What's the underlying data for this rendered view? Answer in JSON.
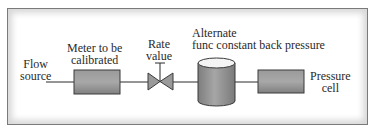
{
  "diagram": {
    "type": "flow-calibration-setup",
    "labels": {
      "flow_source": [
        "Flow",
        "source"
      ],
      "meter": [
        "Meter to be",
        "calibrated"
      ],
      "rate_valve": [
        "Rate",
        "value"
      ],
      "back_pressure": [
        "Alternate",
        "func constant back pressure"
      ],
      "pressure_cell": [
        "Pressure",
        "cell"
      ]
    },
    "components": [
      {
        "id": "flow-source",
        "shape": "line-start"
      },
      {
        "id": "meter",
        "shape": "rectangle"
      },
      {
        "id": "rate-valve",
        "shape": "valve"
      },
      {
        "id": "back-pressure-tank",
        "shape": "cylinder"
      },
      {
        "id": "pressure-cell",
        "shape": "rectangle"
      }
    ],
    "colors": {
      "component_fill": "#8c8c8c",
      "component_stroke": "#3a3a3a",
      "line": "#2a2a2a",
      "frame_border": "#7a7a7a",
      "frame_shadow": "#d8d8d8"
    }
  }
}
